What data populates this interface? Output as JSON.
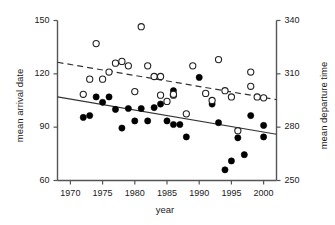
{
  "chart_data": {
    "type": "scatter",
    "title": "",
    "xlabel": "year",
    "ylabel": "mean arrival date",
    "ylabel_right": "mean departure time",
    "xlim": [
      1968,
      2002
    ],
    "ylim": [
      60,
      150
    ],
    "ylim_right": [
      250,
      340
    ],
    "xticks": [
      1970,
      1975,
      1980,
      1985,
      1990,
      1995,
      2000
    ],
    "yticks_left": [
      60,
      90,
      120,
      150
    ],
    "yticks_right": [
      250,
      280,
      310,
      340
    ],
    "grid": false,
    "legend": "none",
    "series": [
      {
        "name": "mean arrival date",
        "marker": "filled-circle",
        "color": "#000000",
        "axis": "left",
        "points": [
          [
            1972,
            95.5
          ],
          [
            1973,
            96.5
          ],
          [
            1974,
            107
          ],
          [
            1975,
            104
          ],
          [
            1976,
            107
          ],
          [
            1977,
            100
          ],
          [
            1978,
            89.5
          ],
          [
            1979,
            100.5
          ],
          [
            1980,
            93.5
          ],
          [
            1981,
            100.5
          ],
          [
            1982,
            93.5
          ],
          [
            1983,
            101
          ],
          [
            1984,
            103
          ],
          [
            1985,
            93.5
          ],
          [
            1986,
            110.5
          ],
          [
            1986,
            91.5
          ],
          [
            1987,
            91.5
          ],
          [
            1988,
            84.5
          ],
          [
            1990,
            118
          ],
          [
            1992,
            103
          ],
          [
            1993,
            92.5
          ],
          [
            1994,
            66
          ],
          [
            1995,
            71
          ],
          [
            1996,
            84
          ],
          [
            1997,
            74.5
          ],
          [
            1998,
            96.5
          ],
          [
            2000,
            91
          ],
          [
            2000,
            84.5
          ]
        ]
      },
      {
        "name": "mean departure time",
        "marker": "open-circle",
        "color": "#000000",
        "axis": "right",
        "points": [
          [
            1972,
            108.5
          ],
          [
            1973,
            117
          ],
          [
            1974,
            137
          ],
          [
            1975,
            117
          ],
          [
            1976,
            121
          ],
          [
            1977,
            126
          ],
          [
            1978,
            127
          ],
          [
            1979,
            124.5
          ],
          [
            1980,
            110
          ],
          [
            1981,
            146.5
          ],
          [
            1982,
            124.5
          ],
          [
            1983,
            118.5
          ],
          [
            1984,
            118.5
          ],
          [
            1984,
            108
          ],
          [
            1985,
            104.5
          ],
          [
            1986,
            108
          ],
          [
            1986,
            108.5
          ],
          [
            1988,
            97.5
          ],
          [
            1989,
            124.5
          ],
          [
            1991,
            109
          ],
          [
            1992,
            105
          ],
          [
            1993,
            128
          ],
          [
            1994,
            110.5
          ],
          [
            1995,
            107
          ],
          [
            1996,
            88
          ],
          [
            1998,
            113
          ],
          [
            1998,
            121
          ],
          [
            1999,
            107
          ],
          [
            2000,
            106.5
          ]
        ]
      }
    ],
    "trend_lines": [
      {
        "name": "arrival-trend",
        "style": "solid",
        "axis": "left",
        "x_start": 1968,
        "y_start": 107,
        "x_end": 2002,
        "y_end": 86
      },
      {
        "name": "departure-trend",
        "style": "dashed",
        "axis": "left",
        "x_start": 1968,
        "y_start": 126.5,
        "x_end": 2002,
        "y_end": 105.5
      }
    ]
  },
  "ticks": {
    "x": [
      "1970",
      "1975",
      "1980",
      "1985",
      "1990",
      "1995",
      "2000"
    ],
    "left": [
      "150",
      "120",
      "90",
      "60"
    ],
    "right": [
      "340",
      "310",
      "280",
      "250"
    ]
  },
  "labels": {
    "x_axis": "year",
    "y_axis_left": "mean arrival date",
    "y_axis_right": "mean departure time"
  }
}
